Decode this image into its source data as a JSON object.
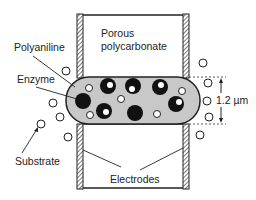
{
  "diagram": {
    "type": "cross-section schematic",
    "labels": {
      "membrane_line1": "Porous",
      "membrane_line2": "polycarbonate",
      "polyaniline": "Polyaniline",
      "enzyme": "Enzyme",
      "substrate": "Substrate",
      "electrodes": "Electrodes",
      "thickness": "1.2 µm"
    },
    "colors": {
      "polyaniline_fill": "#c8c8c8",
      "enzyme_fill": "#111111",
      "outline": "#222222",
      "background": "#ffffff"
    },
    "enzymes": [
      {
        "cx": 83,
        "cy": 101,
        "r": 8,
        "hx": 83,
        "hy": 101,
        "hr": 0
      },
      {
        "cx": 108,
        "cy": 86,
        "r": 8,
        "hx": 110,
        "hy": 85,
        "hr": 3
      },
      {
        "cx": 104,
        "cy": 111,
        "r": 8,
        "hx": 106,
        "hy": 112,
        "hr": 3
      },
      {
        "cx": 133,
        "cy": 86,
        "r": 8,
        "hx": 132,
        "hy": 89,
        "hr": 3
      },
      {
        "cx": 135,
        "cy": 113,
        "r": 8,
        "hx": 135,
        "hy": 113,
        "hr": 0
      },
      {
        "cx": 160,
        "cy": 87,
        "r": 8,
        "hx": 161,
        "hy": 85,
        "hr": 3
      },
      {
        "cx": 176,
        "cy": 104,
        "r": 8,
        "hx": 179,
        "hy": 102,
        "hr": 3
      }
    ],
    "inner_substrate": [
      {
        "cx": 89,
        "cy": 88,
        "r": 3.5
      },
      {
        "cx": 121,
        "cy": 99,
        "r": 3.5
      },
      {
        "cx": 90,
        "cy": 115,
        "r": 3.5
      },
      {
        "cx": 157,
        "cy": 114,
        "r": 3.5
      },
      {
        "cx": 182,
        "cy": 91,
        "r": 3.5
      }
    ],
    "outer_substrate": [
      {
        "cx": 66,
        "cy": 71,
        "r": 4
      },
      {
        "cx": 203,
        "cy": 63,
        "r": 4
      },
      {
        "cx": 208,
        "cy": 83,
        "r": 4
      },
      {
        "cx": 53,
        "cy": 103,
        "r": 4
      },
      {
        "cx": 60,
        "cy": 117,
        "r": 4
      },
      {
        "cx": 207,
        "cy": 101,
        "r": 4
      },
      {
        "cx": 41,
        "cy": 124,
        "r": 4
      },
      {
        "cx": 209,
        "cy": 117,
        "r": 4
      },
      {
        "cx": 68,
        "cy": 137,
        "r": 4
      },
      {
        "cx": 200,
        "cy": 135,
        "r": 4
      }
    ]
  }
}
